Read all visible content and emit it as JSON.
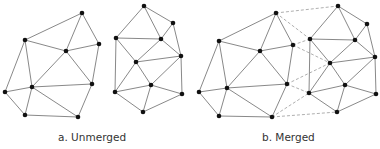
{
  "captions": {
    "unmerged": "a. Unmerged",
    "merged": "b. Merged"
  },
  "colors": {
    "edge": "#7a7a7a",
    "dashed_edge": "#9a9a9a",
    "node": "#111111",
    "text": "#333333"
  },
  "panels": [
    {
      "id": "unmerged",
      "meshes": [
        {
          "nodes": {
            "A": [
              82,
              13
            ],
            "B": [
              25,
              40
            ],
            "C": [
              66,
              51
            ],
            "D": [
              99,
              44
            ],
            "E": [
              32,
              87
            ],
            "F": [
              5,
              92
            ],
            "G": [
              92,
              84
            ],
            "H": [
              25,
              115
            ],
            "I": [
              78,
              117
            ]
          },
          "edges": [
            [
              "A",
              "B"
            ],
            [
              "A",
              "C"
            ],
            [
              "A",
              "D"
            ],
            [
              "B",
              "C"
            ],
            [
              "B",
              "E"
            ],
            [
              "B",
              "F"
            ],
            [
              "C",
              "D"
            ],
            [
              "C",
              "E"
            ],
            [
              "C",
              "G"
            ],
            [
              "D",
              "G"
            ],
            [
              "E",
              "F"
            ],
            [
              "E",
              "G"
            ],
            [
              "E",
              "H"
            ],
            [
              "E",
              "I"
            ],
            [
              "F",
              "H"
            ],
            [
              "H",
              "I"
            ],
            [
              "G",
              "I"
            ]
          ]
        },
        {
          "nodes": {
            "J": [
              144,
              6
            ],
            "K": [
              173,
              23
            ],
            "L": [
              116,
              38
            ],
            "M": [
              161,
              39
            ],
            "N": [
              136,
              62
            ],
            "O": [
              181,
              56
            ],
            "P": [
              115,
              92
            ],
            "Q": [
              151,
              85
            ],
            "R": [
              182,
              94
            ],
            "S": [
              143,
              112
            ]
          },
          "edges": [
            [
              "J",
              "L"
            ],
            [
              "J",
              "M"
            ],
            [
              "J",
              "K"
            ],
            [
              "K",
              "M"
            ],
            [
              "K",
              "O"
            ],
            [
              "L",
              "M"
            ],
            [
              "L",
              "N"
            ],
            [
              "L",
              "P"
            ],
            [
              "M",
              "N"
            ],
            [
              "M",
              "O"
            ],
            [
              "N",
              "O"
            ],
            [
              "N",
              "P"
            ],
            [
              "N",
              "Q"
            ],
            [
              "O",
              "Q"
            ],
            [
              "O",
              "R"
            ],
            [
              "P",
              "Q"
            ],
            [
              "P",
              "S"
            ],
            [
              "Q",
              "S"
            ],
            [
              "Q",
              "R"
            ],
            [
              "R",
              "S"
            ]
          ]
        }
      ]
    },
    {
      "id": "merged",
      "meshes": [
        {
          "nodes": {
            "A": [
              276,
              13
            ],
            "B": [
              219,
              41
            ],
            "C": [
              260,
              51
            ],
            "D": [
              293,
              45
            ],
            "E": [
              227,
              88
            ],
            "F": [
              199,
              92
            ],
            "G": [
              287,
              84
            ],
            "H": [
              219,
              116
            ],
            "I": [
              272,
              117
            ]
          },
          "edges": [
            [
              "A",
              "B"
            ],
            [
              "A",
              "C"
            ],
            [
              "A",
              "D"
            ],
            [
              "B",
              "C"
            ],
            [
              "B",
              "E"
            ],
            [
              "B",
              "F"
            ],
            [
              "C",
              "D"
            ],
            [
              "C",
              "E"
            ],
            [
              "C",
              "G"
            ],
            [
              "D",
              "G"
            ],
            [
              "E",
              "F"
            ],
            [
              "E",
              "G"
            ],
            [
              "E",
              "H"
            ],
            [
              "E",
              "I"
            ],
            [
              "F",
              "H"
            ],
            [
              "H",
              "I"
            ],
            [
              "G",
              "I"
            ]
          ]
        },
        {
          "nodes": {
            "J": [
              338,
              6
            ],
            "K": [
              367,
              24
            ],
            "L": [
              310,
              39
            ],
            "M": [
              355,
              40
            ],
            "N": [
              330,
              63
            ],
            "O": [
              375,
              57
            ],
            "P": [
              309,
              93
            ],
            "Q": [
              345,
              85
            ],
            "R": [
              376,
              94
            ],
            "S": [
              337,
              112
            ]
          },
          "edges": [
            [
              "J",
              "L"
            ],
            [
              "J",
              "M"
            ],
            [
              "J",
              "K"
            ],
            [
              "K",
              "M"
            ],
            [
              "K",
              "O"
            ],
            [
              "L",
              "M"
            ],
            [
              "L",
              "N"
            ],
            [
              "L",
              "P"
            ],
            [
              "M",
              "N"
            ],
            [
              "M",
              "O"
            ],
            [
              "N",
              "O"
            ],
            [
              "N",
              "P"
            ],
            [
              "N",
              "Q"
            ],
            [
              "O",
              "Q"
            ],
            [
              "O",
              "R"
            ],
            [
              "P",
              "Q"
            ],
            [
              "P",
              "S"
            ],
            [
              "Q",
              "S"
            ],
            [
              "Q",
              "R"
            ],
            [
              "R",
              "S"
            ]
          ]
        }
      ],
      "merge_edges": [
        [
          [
            276,
            13
          ],
          [
            338,
            6
          ]
        ],
        [
          [
            276,
            13
          ],
          [
            310,
            39
          ]
        ],
        [
          [
            293,
            45
          ],
          [
            310,
            39
          ]
        ],
        [
          [
            293,
            45
          ],
          [
            330,
            63
          ]
        ],
        [
          [
            287,
            84
          ],
          [
            330,
            63
          ]
        ],
        [
          [
            287,
            84
          ],
          [
            309,
            93
          ]
        ],
        [
          [
            272,
            117
          ],
          [
            309,
            93
          ]
        ],
        [
          [
            272,
            117
          ],
          [
            337,
            112
          ]
        ]
      ]
    }
  ]
}
